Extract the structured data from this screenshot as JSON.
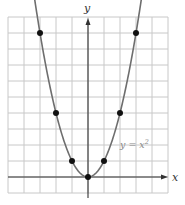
{
  "chart_data": {
    "type": "line",
    "title": "",
    "xlabel": "x",
    "ylabel": "y",
    "curve_label": "y = x²",
    "equation": "y = x^2",
    "xlim": [
      -5,
      5
    ],
    "ylim": [
      -1,
      10
    ],
    "grid": true,
    "series": [
      {
        "name": "y = x²",
        "points": [
          {
            "x": -3,
            "y": 9
          },
          {
            "x": -2,
            "y": 4
          },
          {
            "x": -1,
            "y": 1
          },
          {
            "x": 0,
            "y": 0
          },
          {
            "x": 1,
            "y": 1
          },
          {
            "x": 2,
            "y": 4
          },
          {
            "x": 3,
            "y": 9
          }
        ]
      }
    ]
  },
  "labels": {
    "x_axis": "x",
    "y_axis": "y",
    "curve_y": "y = x",
    "curve_exp": "2"
  },
  "colors": {
    "grid": "#c8c8c8",
    "axis": "#333333",
    "curve": "#6e6e6e",
    "point": "#111111",
    "label": "#888888"
  }
}
